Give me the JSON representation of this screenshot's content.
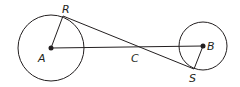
{
  "diagram": {
    "type": "geometry",
    "points": {
      "A": {
        "label": "A",
        "x": 51,
        "y": 48
      },
      "B": {
        "label": "B",
        "x": 203,
        "y": 46
      },
      "C": {
        "label": "C",
        "x": 137,
        "y": 48
      },
      "R": {
        "label": "R",
        "x": 63,
        "y": 16
      },
      "S": {
        "label": "S",
        "x": 194,
        "y": 69
      }
    },
    "circles": [
      {
        "center": "A",
        "r": 33
      },
      {
        "center": "B",
        "r": 24
      }
    ],
    "segments": [
      "AR",
      "AB",
      "RS",
      "BS"
    ],
    "colors": {
      "stroke": "#231f20",
      "background": "#ffffff"
    }
  }
}
